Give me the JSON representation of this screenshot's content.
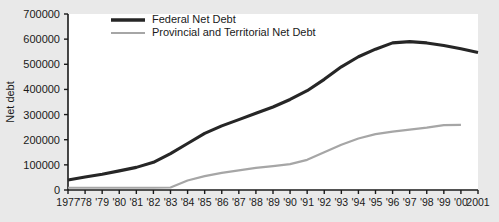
{
  "chart_data": {
    "type": "line",
    "title": "",
    "xlabel": "",
    "ylabel": "Net debt",
    "ylim": [
      0,
      700000
    ],
    "ytick_labels": [
      "0",
      "100000",
      "200000",
      "300000",
      "400000",
      "500000",
      "600000",
      "700000"
    ],
    "ytick_values": [
      0,
      100000,
      200000,
      300000,
      400000,
      500000,
      600000,
      700000
    ],
    "grid": false,
    "legend_position": "top-left-inside",
    "x": [
      1977,
      1978,
      1979,
      1980,
      1981,
      1982,
      1983,
      1984,
      1985,
      1986,
      1987,
      1988,
      1989,
      1990,
      1991,
      1992,
      1993,
      1994,
      1995,
      1996,
      1997,
      1998,
      1999,
      2000,
      2001
    ],
    "xtick_labels": [
      "1977",
      "'78",
      "'79",
      "'80",
      "'81",
      "'82",
      "'83",
      "'84",
      "'85",
      "'86",
      "'87",
      "'88",
      "'89",
      "'90",
      "'91",
      "'92",
      "'93",
      "'94",
      "'95",
      "'96",
      "'97",
      "'98",
      "'99",
      "'00",
      "2001"
    ],
    "series": [
      {
        "name": "Federal Net Debt",
        "color": "#262626",
        "values": [
          40000,
          52000,
          63000,
          76000,
          90000,
          110000,
          145000,
          185000,
          225000,
          255000,
          280000,
          305000,
          330000,
          360000,
          395000,
          440000,
          490000,
          530000,
          560000,
          585000,
          590000,
          585000,
          575000,
          562000,
          547000
        ]
      },
      {
        "name": "Provincial and Territorial Net Debt",
        "color": "#a6a6a6",
        "values": [
          9000,
          9000,
          9000,
          9000,
          9000,
          9000,
          10000,
          38000,
          55000,
          68000,
          78000,
          88000,
          95000,
          103000,
          120000,
          150000,
          180000,
          205000,
          222000,
          232000,
          240000,
          248000,
          258000,
          259000,
          null
        ]
      }
    ]
  },
  "legend": {
    "entries": [
      {
        "label": "Federal Net Debt"
      },
      {
        "label": "Provincial and Territorial Net Debt"
      }
    ]
  }
}
